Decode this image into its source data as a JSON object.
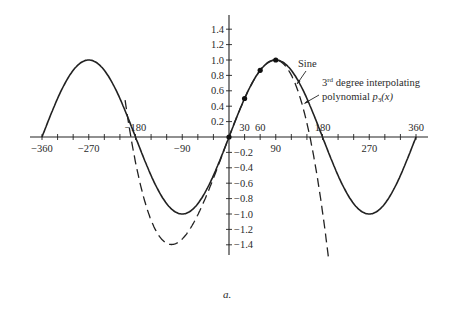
{
  "chart_data": {
    "type": "line",
    "title": "",
    "xlabel": "",
    "ylabel": "",
    "xlim": [
      -360,
      360
    ],
    "ylim": [
      -1.4,
      1.4
    ],
    "grid": false,
    "x_ticks_labeled": [
      -360,
      -270,
      -180,
      -90,
      30,
      60,
      90,
      180,
      270,
      360
    ],
    "x_tick_labels": [
      "−360",
      "−270",
      "−180",
      "−90",
      "30",
      "60",
      "90",
      "180",
      "270",
      "360"
    ],
    "x_minor_tick_step": 30,
    "y_ticks": [
      1.4,
      1.2,
      1.0,
      0.8,
      0.6,
      0.4,
      0.2,
      -0.2,
      -0.4,
      -0.6,
      -0.8,
      -1.0,
      -1.2,
      -1.4
    ],
    "y_tick_labels": [
      "1.4",
      "1.2",
      "1.0",
      "0.8",
      "0.6",
      "0.4",
      "0.2",
      "−0.2",
      "−0.4",
      "−0.6",
      "−0.8",
      "−1.0",
      "−1.2",
      "−1.4"
    ],
    "series": [
      {
        "name": "Sine",
        "style": "solid",
        "function": "sin(x degrees)",
        "x_range": [
          -360,
          360
        ],
        "x": [
          -360,
          -270,
          -180,
          -90,
          0,
          90,
          180,
          270,
          360
        ],
        "values": [
          0,
          1,
          0,
          -1,
          0,
          1,
          0,
          -1,
          0
        ]
      },
      {
        "name": "3rd degree interpolating polynomial p3(x)",
        "style": "dashed",
        "function": "cubic through (0,0),(30,0.5),(60,0.866),(90,1)",
        "x_range": [
          -200,
          200
        ],
        "x": [
          -180,
          -150,
          -120,
          -90,
          -60,
          -30,
          0,
          30,
          60,
          90,
          120,
          150,
          180
        ],
        "values": [
          0.34,
          -0.5,
          -1.07,
          -1.32,
          -1.21,
          -0.72,
          0,
          0.5,
          0.866,
          1.0,
          0.72,
          -0.03,
          -1.34
        ]
      }
    ],
    "interpolation_points": {
      "x": [
        0,
        30,
        60,
        90
      ],
      "y": [
        0,
        0.5,
        0.866,
        1.0
      ]
    },
    "annotations": [
      {
        "text": "Sine",
        "points_to": "solid curve near x=165"
      },
      {
        "text_main": "3rd degree interpolating",
        "superscript": "rd",
        "line2": "polynomial",
        "math": "p₃(x)",
        "points_to": "dashed curve near x=170"
      }
    ]
  },
  "labels": {
    "sine": "Sine",
    "poly_num": "3",
    "poly_sup": "rd",
    "poly_line1_rest": " degree interpolating",
    "poly_line2": "polynomial ",
    "poly_math_p": "p",
    "poly_math_sub": "3",
    "poly_math_arg": "(x)",
    "caption": "a."
  }
}
